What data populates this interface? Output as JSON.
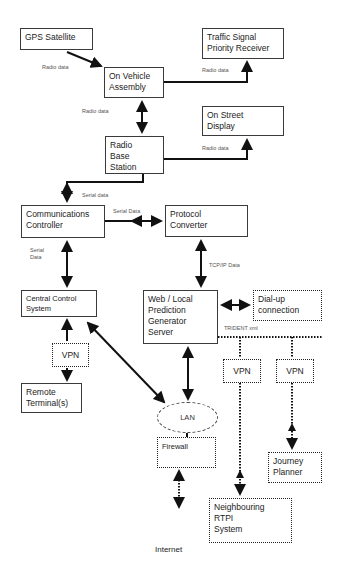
{
  "diagram": {
    "nodes": {
      "gps_satellite": {
        "lines": [
          "GPS Satellite"
        ]
      },
      "traffic_signal": {
        "lines": [
          "Traffic Signal",
          "Priority Receiver"
        ]
      },
      "on_vehicle": {
        "lines": [
          "On Vehicle",
          "Assembly"
        ]
      },
      "on_street": {
        "lines": [
          "On Street",
          "Display"
        ]
      },
      "radio_base": {
        "lines": [
          "Radio",
          "Base",
          "Station"
        ]
      },
      "comms_controller": {
        "lines": [
          "Communications",
          "Controller"
        ]
      },
      "protocol_converter": {
        "lines": [
          "Protocol",
          "Converter"
        ]
      },
      "central_control": {
        "lines": [
          "Central Control",
          "System"
        ]
      },
      "web_server": {
        "lines": [
          "Web / Local",
          "Prediction",
          "Generator",
          "Server"
        ]
      },
      "dialup": {
        "lines": [
          "Dial-up",
          "connection"
        ]
      },
      "vpn_left": {
        "lines": [
          "VPN"
        ]
      },
      "remote_terminals": {
        "lines": [
          "Remote",
          "Terminal(s)"
        ]
      },
      "vpn_mid": {
        "lines": [
          "VPN"
        ]
      },
      "vpn_right": {
        "lines": [
          "VPN"
        ]
      },
      "lan": {
        "lines": [
          "LAN"
        ]
      },
      "firewall": {
        "lines": [
          "Firewall"
        ]
      },
      "journey_planner": {
        "lines": [
          "Journey",
          "Planner"
        ]
      },
      "neighbouring_rtpi": {
        "lines": [
          "Neighbouring",
          "RTPI",
          "System"
        ]
      },
      "internet": {
        "lines": [
          "Internet"
        ]
      }
    },
    "edge_labels": {
      "gps_to_vehicle": "Radio data",
      "vehicle_to_traffic": "Radio data",
      "vehicle_to_base": "Radio data",
      "base_to_street": "Radio data",
      "base_to_comms": "Serial data",
      "comms_to_protocol": "Serial Data",
      "comms_to_central": [
        "Serial",
        "Data"
      ],
      "protocol_to_web": "TCP/IP Data",
      "web_trident": "TRIDENT xml"
    },
    "colors": {
      "line": "#111111",
      "box_border": "#3a3a3a",
      "label": "#555555"
    }
  }
}
